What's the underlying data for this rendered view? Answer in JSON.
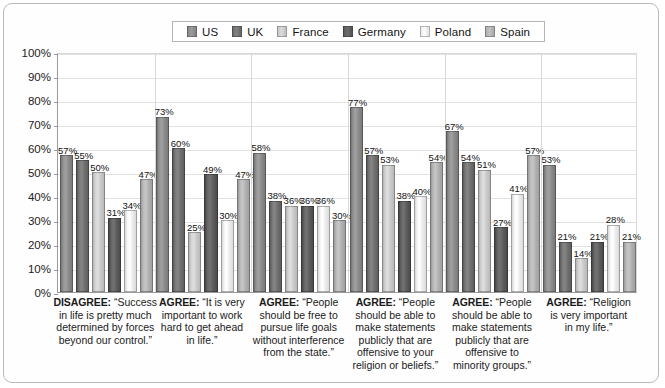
{
  "legend": {
    "items": [
      {
        "label": "US",
        "color": "#8a8a8a"
      },
      {
        "label": "UK",
        "color": "#6f6f6f"
      },
      {
        "label": "France",
        "color": "#c9c9c9"
      },
      {
        "label": "Germany",
        "color": "#5c5c5c"
      },
      {
        "label": "Poland",
        "color": "#ebebeb"
      },
      {
        "label": "Spain",
        "color": "#b0b0b0"
      }
    ]
  },
  "axis": {
    "yticks": [
      "0%",
      "10%",
      "20%",
      "30%",
      "40%",
      "50%",
      "60%",
      "70%",
      "80%",
      "90%",
      "100%"
    ]
  },
  "chart_data": {
    "type": "bar",
    "title": "",
    "xlabel": "",
    "ylabel": "",
    "ylim": [
      0,
      100
    ],
    "grid": true,
    "legend_position": "top-center",
    "value_suffix": "%",
    "categories": [
      "DISAGREE: “Success in life is pretty much determined by forces beyond our control.”",
      "AGREE: “It is very important to work hard to get ahead in life.”",
      "AGREE: “People should be free to pursue life goals without interference from the state.”",
      "AGREE: “People should be able to make statements publicly that are offensive to your religion or beliefs.”",
      "AGREE: “People should be able to make statements publicly that are offensive to minority groups.”",
      "AGREE: “Religion is very important in my life.”"
    ],
    "category_labels": [
      {
        "prefix": "DISAGREE:",
        "lines": [
          "“Success",
          "in life is pretty much",
          "determined by forces",
          "beyond our control.”"
        ]
      },
      {
        "prefix": "AGREE:",
        "lines": [
          "“It is very",
          "important to work",
          "hard to get ahead",
          "in life.”"
        ]
      },
      {
        "prefix": "AGREE:",
        "lines": [
          "“People",
          "should be free to",
          "pursue life goals",
          "without interference",
          "from the state.”"
        ]
      },
      {
        "prefix": "AGREE:",
        "lines": [
          "“People",
          "should be able to",
          "make statements",
          "publicly that are",
          "offensive to your",
          "religion or beliefs.”"
        ]
      },
      {
        "prefix": "AGREE:",
        "lines": [
          "“People",
          "should be able to",
          "make statements",
          "publicly that are",
          "offensive to",
          "minority groups.”"
        ]
      },
      {
        "prefix": "AGREE:",
        "lines": [
          "“Religion",
          "is very important",
          "in my life.”"
        ]
      }
    ],
    "series": [
      {
        "name": "US",
        "color": "#8a8a8a",
        "values": [
          57,
          73,
          58,
          77,
          67,
          53
        ]
      },
      {
        "name": "UK",
        "color": "#6f6f6f",
        "values": [
          55,
          60,
          38,
          57,
          54,
          21
        ]
      },
      {
        "name": "France",
        "color": "#c9c9c9",
        "values": [
          50,
          25,
          36,
          53,
          51,
          14
        ]
      },
      {
        "name": "Germany",
        "color": "#5c5c5c",
        "values": [
          31,
          49,
          36,
          38,
          27,
          21
        ]
      },
      {
        "name": "Poland",
        "color": "#ebebeb",
        "values": [
          34,
          30,
          36,
          40,
          41,
          28
        ]
      },
      {
        "name": "Spain",
        "color": "#b0b0b0",
        "values": [
          47,
          47,
          30,
          54,
          57,
          21
        ]
      }
    ]
  }
}
